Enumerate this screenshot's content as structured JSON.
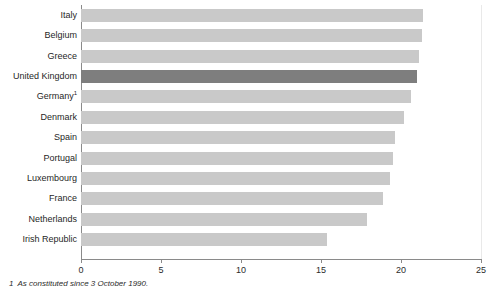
{
  "chart_data": {
    "type": "bar",
    "orientation": "horizontal",
    "title": "",
    "subtitle": "",
    "xlabel": "",
    "ylabel": "",
    "xlim": [
      0,
      25
    ],
    "xticks": [
      0,
      5,
      10,
      15,
      20,
      25
    ],
    "xtick_labels": [
      "0",
      "5",
      "10",
      "15",
      "20",
      "25"
    ],
    "grid": true,
    "grid_axis": "x",
    "legend": false,
    "categories": [
      "Italy",
      "Belgium",
      "Greece",
      "United Kingdom",
      "Germany",
      "Denmark",
      "Spain",
      "Portugal",
      "Luxembourg",
      "France",
      "Netherlands",
      "Irish Republic"
    ],
    "values": [
      21.4,
      21.3,
      21.1,
      21.0,
      20.6,
      20.2,
      19.6,
      19.5,
      19.3,
      18.9,
      17.9,
      15.4
    ],
    "highlight_category": "United Kingdom",
    "bar_color": "#c9c9c9",
    "highlight_color": "#7e7e7e",
    "footnote_markers": {
      "Germany": "1"
    }
  },
  "footnote": {
    "marker": "1",
    "text": "As constituted since 3 October 1990."
  }
}
